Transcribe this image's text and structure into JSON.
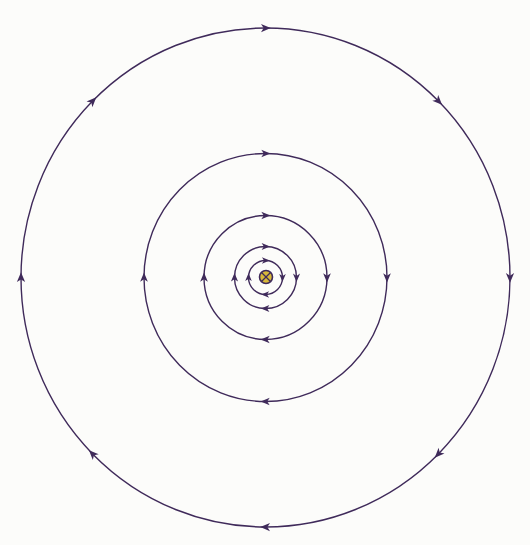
{
  "diagram": {
    "colors": {
      "background": "#fcfcfa",
      "field_line": "#3f2a5a",
      "wire_fill": "#d8b83a",
      "wire_outline": "#3f2a5a"
    },
    "wire": {
      "symbol": "current-into-page",
      "glyph": "⊗"
    },
    "field_lines": [
      {
        "name": "field-line-1",
        "rank": 1,
        "direction": "clockwise",
        "arrow_count": 4
      },
      {
        "name": "field-line-2",
        "rank": 2,
        "direction": "clockwise",
        "arrow_count": 4
      },
      {
        "name": "field-line-3",
        "rank": 3,
        "direction": "clockwise",
        "arrow_count": 4
      },
      {
        "name": "field-line-4",
        "rank": 4,
        "direction": "clockwise",
        "arrow_count": 4
      },
      {
        "name": "field-line-5",
        "rank": 5,
        "direction": "clockwise",
        "arrow_count": 8
      }
    ]
  }
}
